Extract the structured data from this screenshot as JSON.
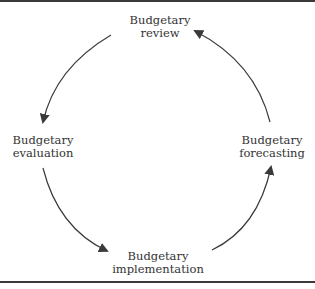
{
  "diagram": {
    "type": "cycle",
    "direction": "counter-clockwise",
    "nodes": [
      {
        "id": "review",
        "line1": "Budgetary",
        "line2": "review"
      },
      {
        "id": "evaluation",
        "line1": "Budgetary",
        "line2": "evaluation"
      },
      {
        "id": "implementation",
        "line1": "Budgetary",
        "line2": "implementation"
      },
      {
        "id": "forecasting",
        "line1": "Budgetary",
        "line2": "forecasting"
      }
    ],
    "edges": [
      {
        "from": "review",
        "to": "evaluation"
      },
      {
        "from": "evaluation",
        "to": "implementation"
      },
      {
        "from": "implementation",
        "to": "forecasting"
      },
      {
        "from": "forecasting",
        "to": "review"
      }
    ],
    "colors": {
      "line": "#3a3a3a",
      "text": "#333333",
      "border": "#3a3a3a",
      "background": "#ffffff"
    }
  }
}
